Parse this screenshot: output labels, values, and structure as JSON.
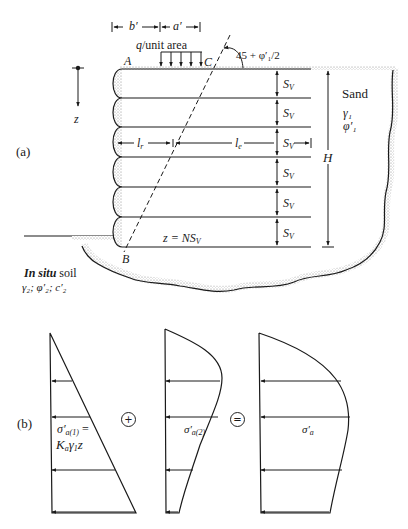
{
  "figure": {
    "part_a": {
      "label": "(a)",
      "dimension_b": "b′",
      "dimension_a": "a′",
      "load_label_q": "q",
      "load_label_rest": "/unit area",
      "point_a": "A",
      "point_b": "B",
      "point_c": "C",
      "angle_label": "45 + φ′₁/2",
      "depth_axis": "z",
      "spacing_label": "S",
      "spacing_sub": "V",
      "spacing_count": 6,
      "length_resisting": "l",
      "length_resisting_sub": "r",
      "length_effective": "l",
      "length_effective_sub": "e",
      "height_label": "H",
      "depth_formula_prefix": "z = NS",
      "depth_formula_sub": "V",
      "backfill": {
        "name": "Sand",
        "unit_weight": "γ₁",
        "friction_angle": "φ′₁"
      },
      "foundation": {
        "name_italic": "In situ",
        "name_rest": " soil",
        "properties": "γ₂; φ′₂; c′₂"
      }
    },
    "part_b": {
      "label": "(b)",
      "plus_symbol": "+",
      "equals_symbol": "=",
      "diagram_1": {
        "stress_label": "σ′",
        "stress_sub": "a(1)",
        "equals": " =",
        "formula": "K",
        "formula_sub": "a",
        "formula_rest_1": "γ",
        "formula_rest_sub": "1",
        "formula_rest_2": "z"
      },
      "diagram_2": {
        "stress_label": "σ′",
        "stress_sub": "a(2)"
      },
      "diagram_3": {
        "stress_label": "σ′",
        "stress_sub": "a"
      }
    },
    "colors": {
      "line": "#1a1a1a",
      "stipple": "#9a9a9a",
      "background": "#ffffff"
    }
  }
}
